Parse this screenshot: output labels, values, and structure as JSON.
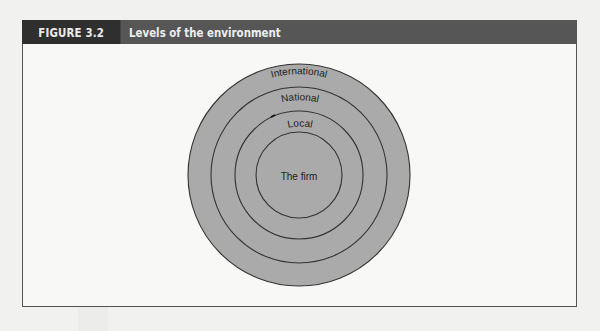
{
  "figure": {
    "label": "FIGURE 3.2",
    "title": "Levels of the environment"
  },
  "diagram": {
    "type": "concentric-circles",
    "levels": [
      {
        "name": "International",
        "order": 1
      },
      {
        "name": "National",
        "order": 2
      },
      {
        "name": "Local",
        "order": 3
      },
      {
        "name": "The firm",
        "order": 4
      }
    ],
    "colors": {
      "fill": "#aaaaaa",
      "stroke": "#333333",
      "header_dark": "#2f2f2f",
      "header_mid": "#565656"
    }
  }
}
